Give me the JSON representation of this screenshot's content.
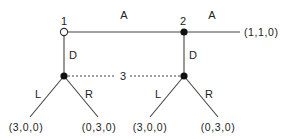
{
  "diagram": {
    "type": "extensive-form game tree",
    "nodes": [
      {
        "id": "1",
        "label": "1",
        "style": "open"
      },
      {
        "id": "2",
        "label": "2",
        "style": "filled"
      },
      {
        "id": "3a",
        "label": "",
        "style": "filled"
      },
      {
        "id": "3b",
        "label": "",
        "style": "filled"
      }
    ],
    "edges": [
      {
        "from": "1",
        "to": "2",
        "label": "A"
      },
      {
        "from": "2",
        "to": "end-A",
        "label": "A"
      },
      {
        "from": "1",
        "to": "3a",
        "label": "D"
      },
      {
        "from": "2",
        "to": "3b",
        "label": "D"
      },
      {
        "from": "3a",
        "to": "leaf-1",
        "label": "L"
      },
      {
        "from": "3a",
        "to": "leaf-2",
        "label": "R"
      },
      {
        "from": "3b",
        "to": "leaf-3",
        "label": "L"
      },
      {
        "from": "3b",
        "to": "leaf-4",
        "label": "R"
      }
    ],
    "information_set": {
      "player": "3",
      "label": "3",
      "members": [
        "3a",
        "3b"
      ]
    },
    "payoffs": {
      "end_A": "(1,1,0)",
      "leaf_1": "(3,0,0)",
      "leaf_2": "(0,3,0)",
      "leaf_3": "(3,0,0)",
      "leaf_4": "(0,3,0)"
    }
  }
}
